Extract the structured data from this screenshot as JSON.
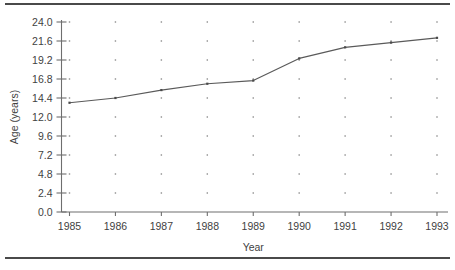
{
  "figure": {
    "top_rule_color": "#4a4a4a",
    "bottom_rule_color": "#4a4a4a"
  },
  "chart_data": {
    "type": "line",
    "title": "",
    "subtitle": "",
    "xlabel": "Year",
    "ylabel": "Age (years)",
    "categories": [
      "1985",
      "1986",
      "1987",
      "1988",
      "1989",
      "1990",
      "1991",
      "1992",
      "1993"
    ],
    "x": [
      1985,
      1986,
      1987,
      1988,
      1989,
      1990,
      1991,
      1992,
      1993
    ],
    "values": [
      13.8,
      14.4,
      15.4,
      16.2,
      16.6,
      19.4,
      20.8,
      21.4,
      22.0
    ],
    "series": [
      {
        "name": "Age",
        "values": [
          13.8,
          14.4,
          15.4,
          16.2,
          16.6,
          19.4,
          20.8,
          21.4,
          22.0
        ],
        "color": "#5a5a5a"
      }
    ],
    "ylim": [
      0.0,
      24.0
    ],
    "ytick_labels": [
      "0.0",
      "2.4",
      "4.8",
      "7.2",
      "9.6",
      "12.0",
      "14.4",
      "16.8",
      "19.2",
      "21.6",
      "24.0"
    ],
    "yticks": [
      0.0,
      2.4,
      4.8,
      7.2,
      9.6,
      12.0,
      14.4,
      16.8,
      19.2,
      21.6,
      24.0
    ],
    "xtick_labels": [
      "1985",
      "1986",
      "1987",
      "1988",
      "1989",
      "1990",
      "1991",
      "1992",
      "1993"
    ],
    "grid": "dots",
    "legend": "none",
    "line_color": "#5a5a5a",
    "axis_color": "#6e6e6e",
    "grid_dot_color": "#8c8c8c",
    "annotations": []
  }
}
